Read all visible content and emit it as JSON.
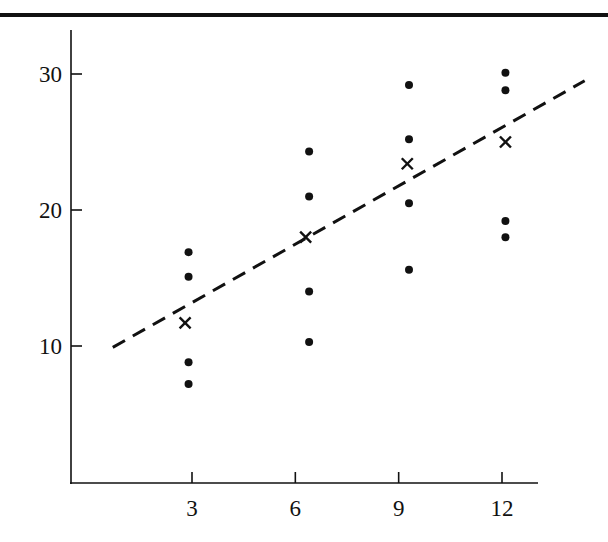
{
  "chart_data": {
    "type": "scatter",
    "title": "",
    "xlabel": "",
    "ylabel": "",
    "xlim": [
      -0.6,
      13.6
    ],
    "ylim": [
      0,
      33
    ],
    "x_ticks": [
      3,
      6,
      9,
      12
    ],
    "x_tick_labels": [
      "3",
      "6",
      "9",
      "12"
    ],
    "y_ticks": [
      10,
      20,
      30
    ],
    "y_tick_labels": [
      "10",
      "20",
      "30"
    ],
    "grid": false,
    "legend": null,
    "series": [
      {
        "name": "observations",
        "marker": "dot",
        "points": [
          {
            "x": 2.9,
            "y": 16.9
          },
          {
            "x": 2.9,
            "y": 15.1
          },
          {
            "x": 2.9,
            "y": 8.8
          },
          {
            "x": 2.9,
            "y": 7.2
          },
          {
            "x": 6.4,
            "y": 24.3
          },
          {
            "x": 6.4,
            "y": 21.0
          },
          {
            "x": 6.4,
            "y": 14.0
          },
          {
            "x": 6.4,
            "y": 10.3
          },
          {
            "x": 9.3,
            "y": 29.2
          },
          {
            "x": 9.3,
            "y": 25.2
          },
          {
            "x": 9.3,
            "y": 20.5
          },
          {
            "x": 9.3,
            "y": 15.6
          },
          {
            "x": 12.1,
            "y": 30.1
          },
          {
            "x": 12.1,
            "y": 28.8
          },
          {
            "x": 12.1,
            "y": 19.2
          },
          {
            "x": 12.1,
            "y": 18.0
          }
        ]
      },
      {
        "name": "group means",
        "marker": "x",
        "points": [
          {
            "x": 2.8,
            "y": 11.7
          },
          {
            "x": 6.3,
            "y": 18.0
          },
          {
            "x": 9.25,
            "y": 23.4
          },
          {
            "x": 12.1,
            "y": 25.0
          }
        ]
      }
    ],
    "fit_line": {
      "style": "dashed",
      "x": [
        0.7,
        14.4
      ],
      "y": [
        9.9,
        29.5
      ]
    }
  },
  "colors": {
    "ink": "#111111",
    "background": "#ffffff"
  }
}
